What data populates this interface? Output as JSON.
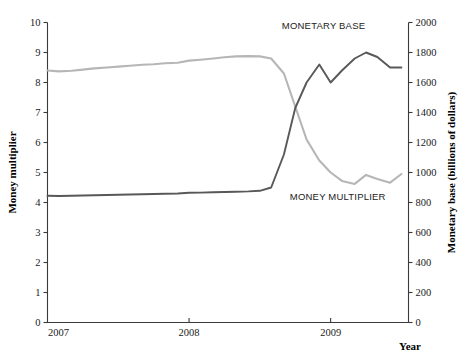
{
  "chart_data": {
    "type": "line",
    "title": "",
    "xlabel": "Year",
    "ylabel": "Money multiplier",
    "y2label": "Monetary base (billions of dollars)",
    "grid": false,
    "legend_position": "inline-annotation",
    "xlim": [
      2007.0,
      2009.55
    ],
    "xticks": [
      2007,
      2008,
      2009
    ],
    "xtick_labels": [
      "2007",
      "2008",
      "2009"
    ],
    "ylim": [
      0,
      10
    ],
    "yticks": [
      0,
      1,
      2,
      3,
      4,
      5,
      6,
      7,
      8,
      9,
      10
    ],
    "ytick_labels": [
      "0",
      "1",
      "2",
      "3",
      "4",
      "5",
      "6",
      "7",
      "8",
      "9",
      "10"
    ],
    "y2lim": [
      0,
      2000
    ],
    "y2ticks": [
      0,
      200,
      400,
      600,
      800,
      1000,
      1200,
      1400,
      1600,
      1800,
      2000
    ],
    "y2tick_labels": [
      "0",
      "200",
      "400",
      "600",
      "800",
      "1000",
      "1200",
      "1400",
      "1600",
      "1800",
      "2000"
    ],
    "series": [
      {
        "name": "MONEY MULTIPLIER",
        "axis": "left",
        "color": "#b6b6b6",
        "annotation": "MONEY MULTIPLIER",
        "x": [
          2007.0,
          2007.08,
          2007.17,
          2007.25,
          2007.33,
          2007.42,
          2007.5,
          2007.58,
          2007.67,
          2007.75,
          2007.83,
          2007.92,
          2008.0,
          2008.08,
          2008.17,
          2008.25,
          2008.33,
          2008.42,
          2008.5,
          2008.58,
          2008.67,
          2008.75,
          2008.83,
          2008.92,
          2009.0,
          2009.08,
          2009.17,
          2009.25,
          2009.33,
          2009.42,
          2009.5
        ],
        "values": [
          8.4,
          8.37,
          8.39,
          8.43,
          8.47,
          8.5,
          8.53,
          8.56,
          8.59,
          8.61,
          8.64,
          8.66,
          8.73,
          8.76,
          8.8,
          8.84,
          8.87,
          8.88,
          8.87,
          8.8,
          8.3,
          7.2,
          6.1,
          5.4,
          5.0,
          4.72,
          4.62,
          4.92,
          4.78,
          4.66,
          4.95
        ]
      },
      {
        "name": "MONETARY BASE",
        "axis": "right",
        "color": "#585858",
        "annotation": "MONETARY BASE",
        "x": [
          2007.0,
          2007.08,
          2007.17,
          2007.25,
          2007.33,
          2007.42,
          2007.5,
          2007.58,
          2007.67,
          2007.75,
          2007.83,
          2007.92,
          2008.0,
          2008.08,
          2008.17,
          2008.25,
          2008.33,
          2008.42,
          2008.5,
          2008.58,
          2008.67,
          2008.75,
          2008.83,
          2008.92,
          2009.0,
          2009.08,
          2009.17,
          2009.25,
          2009.33,
          2009.42,
          2009.5
        ],
        "values": [
          845,
          843,
          845,
          847,
          848,
          850,
          852,
          853,
          855,
          857,
          858,
          860,
          865,
          866,
          868,
          870,
          872,
          874,
          878,
          900,
          1120,
          1430,
          1600,
          1720,
          1600,
          1680,
          1760,
          1800,
          1770,
          1700,
          1700
        ]
      }
    ]
  },
  "annotations": {
    "monetary_base": {
      "label": "MONETARY BASE",
      "x": 2008.95,
      "y_right": 1960
    },
    "money_multiplier": {
      "label": "MONEY MULTIPLIER",
      "x": 2009.05,
      "y_left": 4.1
    }
  },
  "axis_titles": {
    "left": "Money multiplier",
    "right": "Monetary base (billions of dollars)",
    "bottom": "Year"
  }
}
